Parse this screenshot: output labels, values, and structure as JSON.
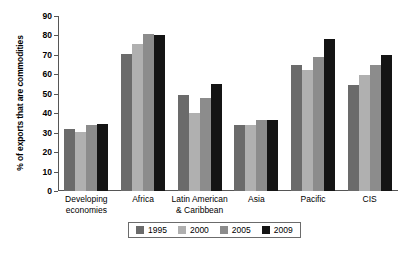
{
  "chart_data": {
    "type": "bar",
    "title": "",
    "xlabel": "",
    "ylabel": "% of exports that are commodities",
    "ylim": [
      0,
      90
    ],
    "ytick_step": 10,
    "yticks": [
      0,
      10,
      20,
      30,
      40,
      50,
      60,
      70,
      80,
      90
    ],
    "grid": false,
    "legend_position": "bottom",
    "categories": [
      "Developing\neconomies",
      "Africa",
      "Latin American\n& Caribbean",
      "Asia",
      "Pacific",
      "CIS"
    ],
    "categories_lines": [
      [
        "Developing",
        "economies"
      ],
      [
        "Africa",
        ""
      ],
      [
        "Latin American",
        "& Caribbean"
      ],
      [
        "Asia",
        ""
      ],
      [
        "Pacific",
        ""
      ],
      [
        "CIS",
        ""
      ]
    ],
    "series": [
      {
        "name": "1995",
        "color": "#6b6b6b",
        "values": [
          32,
          70.5,
          49.5,
          34,
          65,
          54.5
        ]
      },
      {
        "name": "2000",
        "color": "#b0b0b0",
        "values": [
          30.5,
          75.5,
          40,
          34,
          62,
          59.5
        ]
      },
      {
        "name": "2005",
        "color": "#8c8c8c",
        "values": [
          34,
          81,
          48,
          36.5,
          69,
          65
        ]
      },
      {
        "name": "2009",
        "color": "#141414",
        "values": [
          34.5,
          80,
          55,
          36.5,
          78,
          70
        ]
      }
    ]
  },
  "legend": {
    "items": [
      {
        "label": "1995",
        "color": "#6b6b6b"
      },
      {
        "label": "2000",
        "color": "#b0b0b0"
      },
      {
        "label": "2005",
        "color": "#8c8c8c"
      },
      {
        "label": "2009",
        "color": "#141414"
      }
    ]
  },
  "colors": {
    "axis": "#565656",
    "legend_border": "#6b6b6b",
    "background": "#ffffff",
    "text": "#000000"
  }
}
